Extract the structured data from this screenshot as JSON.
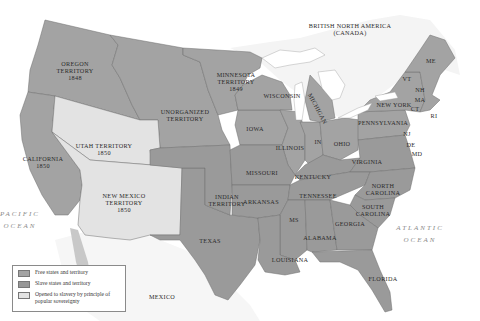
{
  "map": {
    "colors": {
      "free": "#a3a3a3",
      "slave": "#9a9a9a",
      "popular_sovereignty": "#e3e3e3",
      "foreign": "#f0f0f0",
      "water": "#ffffff",
      "border": "#6e6e6e"
    },
    "regions": {
      "british_north_america": "BRITISH NORTH AMERICA",
      "canada": "(CANADA)",
      "oregon": "OREGON",
      "oregon_territory": "TERRITORY",
      "oregon_year": "1848",
      "minnesota": "MINNESOTA",
      "minnesota_territory": "TERRITORY",
      "minnesota_year": "1849",
      "unorganized": "UNORGANIZED",
      "unorganized_territory": "TERRITORY",
      "utah": "UTAH TERRITORY",
      "utah_year": "1850",
      "california": "CALIFORNIA",
      "california_year": "1850",
      "new_mexico": "NEW MEXICO",
      "new_mexico_territory": "TERRITORY",
      "new_mexico_year": "1850",
      "indian": "INDIAN",
      "indian_territory": "TERRITORY",
      "texas": "TEXAS",
      "mexico": "MEXICO",
      "wisconsin": "WISCONSIN",
      "michigan": "MICHIGAN",
      "iowa": "IOWA",
      "illinois": "ILLINOIS",
      "indiana": "IN",
      "ohio": "OHIO",
      "missouri": "MISSOURI",
      "kentucky": "KENTUCKY",
      "arkansas": "ARKANSAS",
      "tennessee": "TENNESSEE",
      "mississippi": "MS",
      "alabama": "ALABAMA",
      "georgia": "GEORGIA",
      "louisiana": "LOUISIANA",
      "florida": "FLORIDA",
      "south_carolina_1": "SOUTH",
      "south_carolina_2": "CAROLINA",
      "north_carolina_1": "NORTH",
      "north_carolina_2": "CAROLINA",
      "virginia": "VIRGINIA",
      "pennsylvania": "PENNSYLVANIA",
      "new_york": "NEW YORK",
      "vermont": "VT",
      "new_hampshire": "NH",
      "maine": "ME",
      "massachusetts": "MA",
      "connecticut": "CT",
      "rhode_island": "RI",
      "new_jersey": "NJ",
      "delaware": "DE",
      "maryland": "MD"
    },
    "oceans": {
      "pacific_1": "PACIFIC",
      "pacific_2": "OCEAN",
      "atlantic_1": "ATLANTIC",
      "atlantic_2": "OCEAN"
    }
  },
  "legend": {
    "items": [
      {
        "label": "Free states and territory",
        "color": "#a3a3a3"
      },
      {
        "label": "Slave states and territory",
        "color": "#979797"
      },
      {
        "label": "Opened to slavery by principle of popular sovereignty",
        "color": "#e3e3e3"
      }
    ]
  }
}
